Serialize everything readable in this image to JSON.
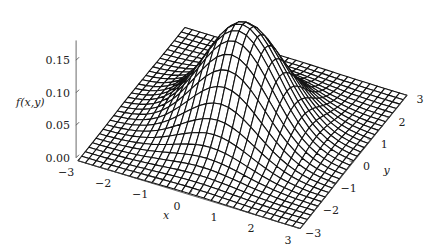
{
  "chart_data": {
    "type": "surface",
    "function": "bivariate standard normal density f(x,y) = exp(-(x^2+y^2)/2) / (2*pi)",
    "title": "",
    "xlabel": "x",
    "ylabel": "y",
    "zlabel": "f(x,y)",
    "xlim": [
      -3,
      3
    ],
    "ylim": [
      -3,
      3
    ],
    "zlim": [
      0,
      0.17
    ],
    "x_ticks": [
      -3,
      -2,
      -1,
      0,
      1,
      2,
      3
    ],
    "x_tick_labels": [
      "−3",
      "−2",
      "−1",
      "0",
      "1",
      "2",
      "3"
    ],
    "y_ticks": [
      -3,
      -2,
      -1,
      0,
      1,
      2,
      3
    ],
    "y_tick_labels": [
      "−3",
      "−2",
      "−1",
      "0",
      "1",
      "2",
      "3"
    ],
    "z_ticks": [
      0.0,
      0.05,
      0.1,
      0.15
    ],
    "z_tick_labels": [
      "0.00",
      "0.05",
      "0.10",
      "0.15"
    ],
    "grid_resolution": 30,
    "peak": {
      "x": 0,
      "y": 0,
      "z": 0.159
    },
    "mesh_color": "#111111",
    "surface_fill": "#ffffff",
    "grid": false,
    "legend": "none"
  }
}
